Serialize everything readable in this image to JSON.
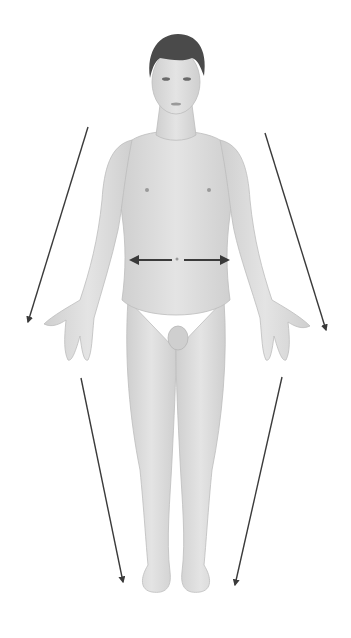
{
  "diagram": {
    "background": "#ffffff",
    "skin_color": "#dedede",
    "skin_shadow": "#c4c4c4",
    "hair_color": "#4a4a4a",
    "arrow_color": "#3a3a3a",
    "arrows": [
      {
        "id": "left-arm-arrow",
        "x1": 88,
        "y1": 127,
        "x2": 28,
        "y2": 322,
        "head": "end"
      },
      {
        "id": "right-arm-arrow",
        "x1": 265,
        "y1": 133,
        "x2": 326,
        "y2": 330,
        "head": "end"
      },
      {
        "id": "left-leg-arrow",
        "x1": 81,
        "y1": 378,
        "x2": 123,
        "y2": 582,
        "head": "end"
      },
      {
        "id": "right-leg-arrow",
        "x1": 282,
        "y1": 377,
        "x2": 235,
        "y2": 585,
        "head": "end"
      },
      {
        "id": "waist-medial-lateral-arrow",
        "x1": 131,
        "y1": 260,
        "x2": 228,
        "y2": 260,
        "head": "both"
      }
    ],
    "labels": []
  }
}
